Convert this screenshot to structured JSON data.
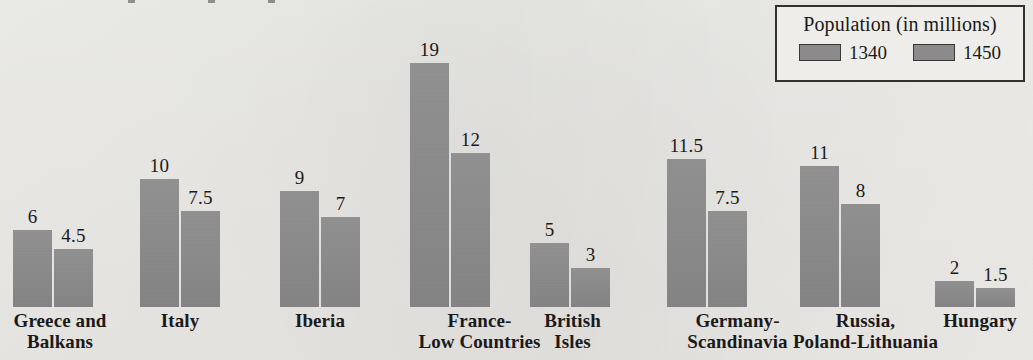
{
  "chart_data": {
    "type": "bar",
    "title": "",
    "xlabel": "",
    "ylabel": "",
    "ylim": [
      0,
      19
    ],
    "grid": false,
    "legend_position": "top-right",
    "legend_title": "Population (in millions)",
    "categories": [
      "Greece and\nBalkans",
      "Italy",
      "Iberia",
      "France-\nLow Countries",
      "British\nIsles",
      "Germany-\nScandinavia",
      "Russia,\nPoland-Lithuania",
      "Hungary"
    ],
    "series": [
      {
        "name": "1340",
        "values": [
          6,
          10,
          9,
          19,
          5,
          11.5,
          11,
          2
        ],
        "labels": [
          "6",
          "10",
          "9",
          "19",
          "5",
          "11.5",
          "11",
          "2"
        ]
      },
      {
        "name": "1450",
        "values": [
          4.5,
          7.5,
          7,
          12,
          3,
          7.5,
          8,
          1.5
        ],
        "labels": [
          "4.5",
          "7.5",
          "7",
          "12",
          "3",
          "7.5",
          "8",
          "1.5"
        ]
      }
    ]
  },
  "colors": {
    "bar_fill": "#8b8b8b",
    "background": "#eeeeeb",
    "text": "#1a1a1a",
    "legend_border": "#33302e",
    "swatch_border": "#3a3734"
  },
  "layout": {
    "group_left_px": [
      13,
      140,
      280,
      410,
      530,
      667,
      800,
      935
    ],
    "label_left_px": [
      -5,
      140,
      280,
      392,
      525,
      650,
      773,
      930
    ],
    "label_width_px": [
      130,
      80,
      80,
      175,
      95,
      175,
      185,
      100
    ],
    "px_per_unit": 12.85,
    "baseline_y_px": 307
  }
}
